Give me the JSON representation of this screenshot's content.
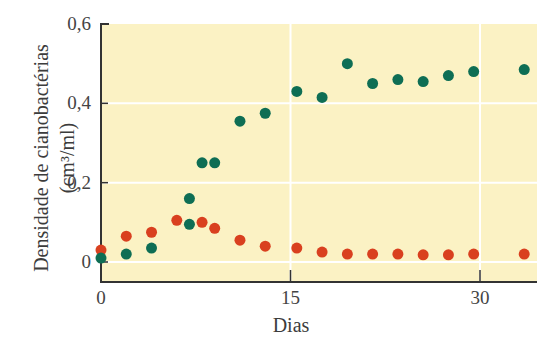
{
  "chart_data": {
    "type": "scatter",
    "title": "",
    "xlabel": "Dias",
    "ylabel": "Densidade de cianobactérias",
    "ylabel_units": "(cm³/ml)",
    "xlim": [
      0,
      34.5
    ],
    "ylim": [
      0,
      0.6
    ],
    "x_ticks": [
      0,
      15,
      30
    ],
    "x_tick_labels": [
      "0",
      "15",
      "30"
    ],
    "y_ticks": [
      0,
      0.2,
      0.4,
      0.6
    ],
    "y_tick_labels": [
      "0",
      "0,2",
      "0,4",
      "0,6"
    ],
    "grid": true,
    "grid_lines": {
      "x": [
        15,
        30
      ],
      "y": [
        0,
        0.2,
        0.4
      ]
    },
    "background_color": "#fbf2c4",
    "legend": null,
    "series": [
      {
        "name": "green",
        "color": "#0e6e54",
        "points": [
          [
            0,
            0.01
          ],
          [
            2,
            0.02
          ],
          [
            4,
            0.035
          ],
          [
            7,
            0.095
          ],
          [
            7,
            0.16
          ],
          [
            8,
            0.25
          ],
          [
            9,
            0.25
          ],
          [
            11,
            0.355
          ],
          [
            13,
            0.375
          ],
          [
            15.5,
            0.43
          ],
          [
            17.5,
            0.415
          ],
          [
            19.5,
            0.5
          ],
          [
            21.5,
            0.45
          ],
          [
            23.5,
            0.46
          ],
          [
            25.5,
            0.455
          ],
          [
            27.5,
            0.47
          ],
          [
            29.5,
            0.48
          ],
          [
            33.5,
            0.485
          ]
        ]
      },
      {
        "name": "red",
        "color": "#d9401f",
        "points": [
          [
            0,
            0.03
          ],
          [
            2,
            0.065
          ],
          [
            4,
            0.075
          ],
          [
            6,
            0.105
          ],
          [
            8,
            0.1
          ],
          [
            9,
            0.085
          ],
          [
            11,
            0.055
          ],
          [
            13,
            0.04
          ],
          [
            15.5,
            0.035
          ],
          [
            17.5,
            0.025
          ],
          [
            19.5,
            0.02
          ],
          [
            21.5,
            0.02
          ],
          [
            23.5,
            0.02
          ],
          [
            25.5,
            0.018
          ],
          [
            27.5,
            0.018
          ],
          [
            29.5,
            0.02
          ],
          [
            33.5,
            0.02
          ]
        ]
      }
    ]
  }
}
